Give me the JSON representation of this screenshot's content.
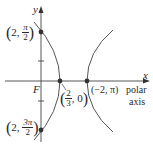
{
  "figure": {
    "axes": {
      "x_label": "x",
      "y_label": "y",
      "polar_axis_label_line1": "polar",
      "polar_axis_label_line2": "axis",
      "focus_label": "F"
    },
    "points": [
      {
        "id": "top",
        "r": "2",
        "theta_num": "π",
        "theta_den": "2"
      },
      {
        "id": "bottom",
        "r": "2",
        "theta_num": "3π",
        "theta_den": "2"
      },
      {
        "id": "vertex-left",
        "num": "2",
        "den": "3",
        "theta": "0"
      },
      {
        "id": "vertex-right",
        "text": "(−2, π)"
      }
    ],
    "colors": {
      "curve": "#555555",
      "axis": "#444444",
      "point": "#333333"
    }
  }
}
